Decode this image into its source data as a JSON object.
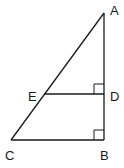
{
  "diagram": {
    "type": "geometry-triangle",
    "points": {
      "A": {
        "label": "A",
        "x": 104,
        "y": 13
      },
      "B": {
        "label": "B",
        "x": 104,
        "y": 140
      },
      "C": {
        "label": "C",
        "x": 11,
        "y": 140
      },
      "D": {
        "label": "D",
        "x": 104,
        "y": 94
      },
      "E": {
        "label": "E",
        "x": 44,
        "y": 94
      }
    },
    "segments": [
      "AC",
      "AB",
      "CB",
      "ED"
    ],
    "right_angles": [
      "D",
      "B"
    ],
    "colors": {
      "stroke": "#1a1a1a",
      "background": "#ffffff"
    }
  }
}
